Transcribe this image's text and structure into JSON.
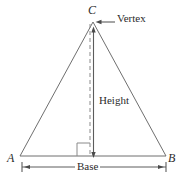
{
  "figure": {
    "name": "triangle-base-height-diagram",
    "background_color": "#ffffff",
    "stroke_color": "#6b6b6b",
    "text_color": "#2b2b2b",
    "labels": {
      "apex_vertex": "C",
      "left_vertex": "A",
      "right_vertex": "B",
      "vertex_callout": "Vertex",
      "height_label": "Height",
      "base_label": "Base"
    },
    "geometry": {
      "apex": [
        93,
        22
      ],
      "left_base": [
        20,
        156
      ],
      "right_base": [
        166,
        156
      ],
      "foot_of_altitude": [
        93,
        156
      ],
      "altitude_dashed_x": 90,
      "altitude_arrow_x": 93.5,
      "right_angle_size": 13,
      "base_dimension_y": 167,
      "base_dimension_x1": 22,
      "base_dimension_x2": 166,
      "vertex_arrow_from": [
        115,
        22
      ],
      "vertex_arrow_to": [
        96,
        22
      ]
    }
  }
}
